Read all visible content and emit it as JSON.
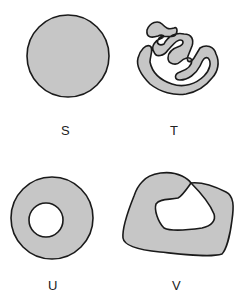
{
  "figures": [
    {
      "id": "S",
      "label": "S",
      "description": "filled disk"
    },
    {
      "id": "T",
      "label": "T",
      "description": "convoluted spiral-like region"
    },
    {
      "id": "U",
      "label": "U",
      "description": "disk with one circular hole (annulus)"
    },
    {
      "id": "V",
      "label": "V",
      "description": "irregular region with hole touching outer boundary"
    }
  ],
  "colors": {
    "fill": "#c6c6c6",
    "stroke": "#1a1a1a",
    "background": "#ffffff"
  }
}
